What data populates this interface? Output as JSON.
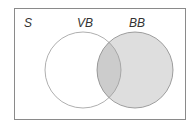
{
  "diagram": {
    "type": "venn",
    "universe": {
      "label": "S",
      "x": 14,
      "y": 8,
      "width": 172,
      "height": 112,
      "stroke": "#8a8a8a",
      "fill": "#ffffff"
    },
    "sets": [
      {
        "label": "VB",
        "cx": 83,
        "cy": 70,
        "r": 38,
        "fill": "#ffffff",
        "stroke": "#999999",
        "shaded": false
      },
      {
        "label": "BB",
        "cx": 135,
        "cy": 70,
        "r": 38,
        "fill": "#dedede",
        "stroke": "#888888",
        "shaded": true
      }
    ],
    "intersection": {
      "fill": "#cccccc",
      "shaded": true
    },
    "labels": {
      "universe": "S",
      "set_a": "VB",
      "set_b": "BB"
    }
  }
}
